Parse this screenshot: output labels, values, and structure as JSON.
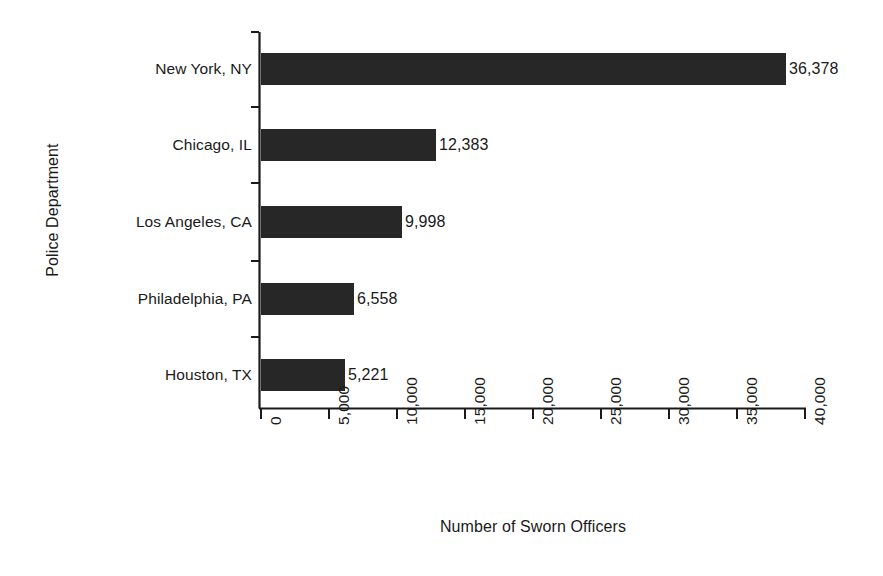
{
  "chart_data": {
    "type": "bar",
    "orientation": "horizontal",
    "title": "",
    "xlabel": "Number of Sworn Officers",
    "ylabel": "Police Department",
    "categories": [
      "New York, NY",
      "Chicago, IL",
      "Los Angeles, CA",
      "Philadelphia, PA",
      "Houston, TX"
    ],
    "values": [
      36378,
      12383,
      9998,
      6558,
      5221
    ],
    "value_labels": [
      "36,378",
      "12,383",
      "9,998",
      "6,558",
      "5,221"
    ],
    "xlim": [
      0,
      40000
    ],
    "xticks": [
      0,
      5000,
      10000,
      15000,
      20000,
      25000,
      30000,
      35000,
      40000
    ],
    "xtick_labels": [
      "0",
      "5,000",
      "10,000",
      "15,000",
      "20,000",
      "25,000",
      "30,000",
      "35,000",
      "40,000"
    ],
    "grid": false,
    "legend": false,
    "bar_color": "#272727",
    "axis_color": "#1a1a1a",
    "background": "#ffffff",
    "xtick_label_rotation": 90,
    "bar_pixel_ends": [
      786,
      436,
      402,
      354,
      345
    ]
  }
}
